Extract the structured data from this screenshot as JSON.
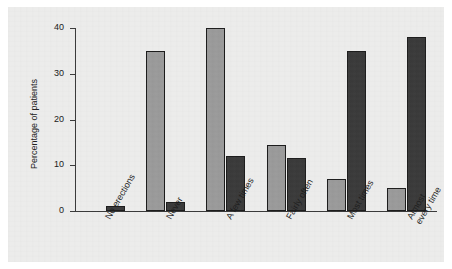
{
  "chart_data": {
    "type": "bar",
    "title": "",
    "subtitle": "",
    "xlabel": "",
    "ylabel": "Percentage of patients",
    "ylim": [
      0,
      40
    ],
    "yticks": [
      0,
      10,
      20,
      30,
      40
    ],
    "ytick_labels": [
      "0",
      "10",
      "20",
      "30",
      "40"
    ],
    "grid": false,
    "legend": "none",
    "categories": [
      "No erections",
      "Never",
      "A few times",
      "Fairly often",
      "Most times",
      "Almost every time"
    ],
    "category_lines": [
      [
        "No erections"
      ],
      [
        "Never"
      ],
      [
        "A few times"
      ],
      [
        "Fairly often"
      ],
      [
        "Most times"
      ],
      [
        "Almost",
        "every time"
      ]
    ],
    "series": [
      {
        "name": "light",
        "color": "#9a9a9a",
        "values": [
          0,
          35,
          40,
          14.5,
          7,
          5
        ]
      },
      {
        "name": "dark",
        "color": "#3a3a3a",
        "values": [
          1,
          2,
          12,
          11.5,
          35,
          38
        ]
      }
    ]
  },
  "colors": {
    "panel_background": "#ececeb",
    "page_background": "#ffffff",
    "axis": "#3b3b3b",
    "bar_light": "#9a9a9a",
    "bar_dark": "#3a3a3a",
    "bar_outline": "#1c1c1c",
    "text": "#202020"
  }
}
